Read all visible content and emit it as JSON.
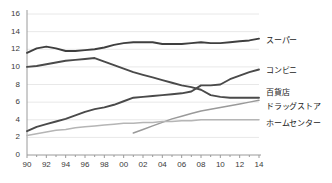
{
  "chart_data": {
    "type": "line",
    "title": "",
    "xlabel": "",
    "ylabel": "",
    "xlim": [
      1990,
      2014
    ],
    "ylim": [
      0,
      16
    ],
    "yticks": [
      0,
      2,
      4,
      6,
      8,
      10,
      12,
      14,
      16
    ],
    "ytick_labels": [
      "0",
      "2",
      "4",
      "6",
      "8",
      "10",
      "12",
      "14",
      "16"
    ],
    "xticks": [
      1990,
      1992,
      1994,
      1996,
      1998,
      2000,
      2002,
      2004,
      2006,
      2008,
      2010,
      2012,
      2014
    ],
    "xtick_labels": [
      "90",
      "92",
      "94",
      "96",
      "98",
      "00",
      "02",
      "04",
      "06",
      "08",
      "10",
      "12",
      "14"
    ],
    "x": [
      1990,
      1991,
      1992,
      1993,
      1994,
      1995,
      1996,
      1997,
      1998,
      1999,
      2000,
      2001,
      2002,
      2003,
      2004,
      2005,
      2006,
      2007,
      2008,
      2009,
      2010,
      2011,
      2012,
      2013,
      2014
    ],
    "grid": true,
    "legend_position": "right",
    "series": [
      {
        "name": "スーパー",
        "color": "#3f3f3f",
        "values": [
          11.6,
          12.1,
          12.3,
          12.1,
          11.8,
          11.8,
          11.9,
          12.0,
          12.2,
          12.5,
          12.7,
          12.8,
          12.8,
          12.8,
          12.6,
          12.6,
          12.6,
          12.7,
          12.8,
          12.7,
          12.7,
          12.8,
          12.9,
          13.0,
          13.2
        ],
        "endpoint_value": 13.2
      },
      {
        "name": "コンビニ",
        "color": "#4a4a4a",
        "values": [
          2.7,
          3.2,
          3.5,
          3.8,
          4.1,
          4.5,
          4.9,
          5.2,
          5.4,
          5.7,
          6.1,
          6.5,
          6.6,
          6.7,
          6.8,
          6.9,
          7.0,
          7.2,
          7.9,
          7.9,
          8.0,
          8.6,
          9.0,
          9.4,
          9.7
        ],
        "endpoint_value": 9.7
      },
      {
        "name": "百貨店",
        "color": "#4a4a4a",
        "values": [
          10.0,
          10.1,
          10.3,
          10.5,
          10.7,
          10.8,
          10.9,
          11.0,
          10.6,
          10.2,
          9.8,
          9.4,
          9.1,
          8.8,
          8.5,
          8.2,
          7.9,
          7.7,
          7.4,
          6.8,
          6.6,
          6.5,
          6.5,
          6.5,
          6.5
        ],
        "endpoint_value": 6.5
      },
      {
        "name": "ドラッグストア",
        "color": "#9a9a9a",
        "values": [
          null,
          null,
          null,
          null,
          null,
          null,
          null,
          null,
          null,
          null,
          null,
          2.5,
          2.9,
          3.3,
          3.7,
          4.1,
          4.4,
          4.7,
          5.0,
          5.2,
          5.4,
          5.6,
          5.8,
          6.0,
          6.2
        ],
        "endpoint_value": 6.2
      },
      {
        "name": "ホームセンター",
        "color": "#b5b5b5",
        "values": [
          2.2,
          2.4,
          2.6,
          2.8,
          2.9,
          3.1,
          3.2,
          3.3,
          3.4,
          3.5,
          3.6,
          3.6,
          3.7,
          3.7,
          3.8,
          3.8,
          3.9,
          3.9,
          4.0,
          4.0,
          4.0,
          4.0,
          4.0,
          4.0,
          4.0
        ],
        "endpoint_value": 4.0
      }
    ]
  },
  "legend": {
    "items": [
      {
        "label": "スーパー"
      },
      {
        "label": "コンビニ"
      },
      {
        "label": "百貨店"
      },
      {
        "label": "ドラッグストア"
      },
      {
        "label": "ホームセンター"
      }
    ]
  },
  "axes": {
    "y_labels": [
      "16",
      "14",
      "12",
      "10",
      "8",
      "6",
      "4",
      "2",
      "0"
    ],
    "x_labels": [
      "90",
      "92",
      "94",
      "96",
      "98",
      "00",
      "02",
      "04",
      "06",
      "08",
      "10",
      "12",
      "14"
    ]
  }
}
